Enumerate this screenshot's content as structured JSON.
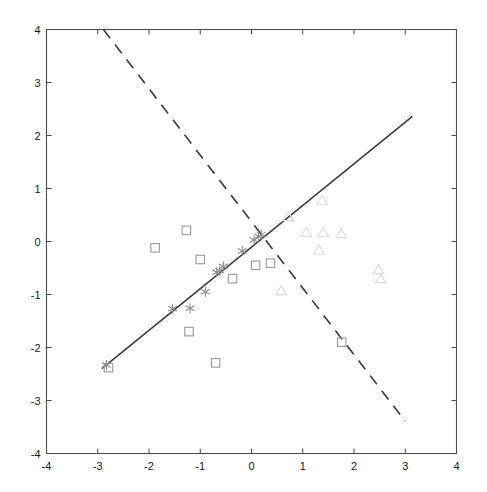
{
  "chart_data": {
    "type": "scatter",
    "title": "",
    "xlabel": "",
    "ylabel": "",
    "xlim": [
      -4,
      4
    ],
    "ylim": [
      -4,
      4
    ],
    "xticks": [
      -4,
      -3,
      -2,
      -1,
      0,
      1,
      2,
      3,
      4
    ],
    "yticks": [
      -4,
      -3,
      -2,
      -1,
      0,
      1,
      2,
      3,
      4
    ],
    "xtick_labels": [
      "-4",
      "-3",
      "-2",
      "-1",
      "0",
      "1",
      "2",
      "3",
      "4"
    ],
    "ytick_labels": [
      "-4",
      "-3",
      "-2",
      "-1",
      "0",
      "1",
      "2",
      "3",
      "4"
    ],
    "grid": false,
    "legend": "none",
    "box": true,
    "series": [
      {
        "name": "squares",
        "marker": "square",
        "color": "#9a9a9a",
        "points": [
          [
            -2.79,
            -2.38
          ],
          [
            -1.88,
            -0.12
          ],
          [
            -1.27,
            0.21
          ],
          [
            -1.22,
            -1.7
          ],
          [
            -1.0,
            -0.34
          ],
          [
            -0.7,
            -2.29
          ],
          [
            -0.37,
            -0.7
          ],
          [
            0.08,
            -0.45
          ],
          [
            0.37,
            -0.41
          ],
          [
            1.76,
            -1.9
          ]
        ]
      },
      {
        "name": "stars",
        "marker": "asterisk",
        "color": "#8c8c8c",
        "points": [
          [
            -2.83,
            -2.33
          ],
          [
            -1.54,
            -1.27
          ],
          [
            -1.2,
            -1.26
          ],
          [
            -0.9,
            -0.95
          ],
          [
            -0.68,
            -0.58
          ],
          [
            -0.62,
            -0.55
          ],
          [
            -0.55,
            -0.47
          ],
          [
            -0.18,
            -0.18
          ],
          [
            0.05,
            0.03
          ],
          [
            0.14,
            0.1
          ],
          [
            0.19,
            0.13
          ]
        ]
      },
      {
        "name": "triangles",
        "marker": "triangle",
        "color": "#dcdcdc",
        "points": [
          [
            0.72,
            0.45
          ],
          [
            1.38,
            0.76
          ],
          [
            1.07,
            0.15
          ],
          [
            1.4,
            0.15
          ],
          [
            1.75,
            0.13
          ],
          [
            1.32,
            -0.18
          ],
          [
            2.48,
            -0.55
          ],
          [
            2.52,
            -0.72
          ],
          [
            0.58,
            -0.95
          ]
        ]
      }
    ],
    "lines": [
      {
        "name": "principal-component-line",
        "style": "solid",
        "color": "#3a3a3a",
        "x0": -2.92,
        "y0": -2.4,
        "x1": 3.14,
        "y1": 2.36
      },
      {
        "name": "discriminant-line",
        "style": "dashed",
        "color": "#3a3a3a",
        "x0": -2.89,
        "y0": 4.0,
        "x1": 3.0,
        "y1": -3.39
      }
    ]
  },
  "axes": {
    "frame_color": "#4d4d4d",
    "tick_color": "#4d4d4d",
    "background": "#ffffff"
  }
}
